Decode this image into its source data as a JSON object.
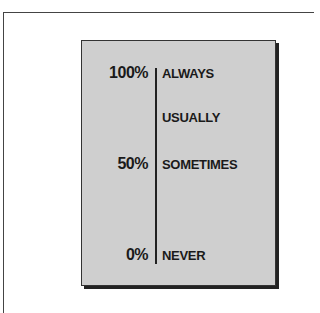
{
  "diagram": {
    "type": "frequency-scale",
    "scale": [
      {
        "percent": "100%",
        "label": "ALWAYS"
      },
      {
        "percent": "",
        "label": "USUALLY"
      },
      {
        "percent": "50%",
        "label": "SOMETIMES"
      },
      {
        "percent": "0%",
        "label": "NEVER"
      }
    ]
  },
  "colors": {
    "card_background": "#cfcfcf",
    "text": "#1a1a1a",
    "page_background": "#ffffff"
  }
}
